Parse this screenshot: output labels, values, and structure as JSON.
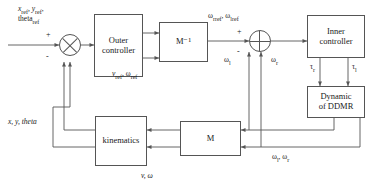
{
  "diagram": {
    "blocks": {
      "outer_controller": "Outer\ncontroller",
      "outer_controller_line1": "Outer",
      "outer_controller_line2": "controller",
      "m_inverse": "M⁻¹",
      "inner_controller_line1": "Inner",
      "inner_controller_line2": "controller",
      "dynamic_line1": "Dynamic",
      "dynamic_line2": "of DDMR",
      "m_matrix": "M",
      "kinematics": "kinematics"
    },
    "labels": {
      "reference_input_line1": "x",
      "reference_input_line1_sub1": "ref",
      "reference_input_line1_mid": ", y",
      "reference_input_line1_sub2": "ref",
      "reference_input_line1_end": ",",
      "reference_input_line2": "theta",
      "reference_input_line2_sub": "ref",
      "outer_output": "v",
      "outer_output_sub1": "ref",
      "outer_output_mid": ",  ω",
      "outer_output_sub2": "ref",
      "wheel_ref": "ω",
      "wheel_ref_sub1": "rref",
      "wheel_ref_mid": ", ω",
      "wheel_ref_sub2": "lref",
      "omega_l": "ω",
      "omega_l_sub": "l",
      "omega_r": "ω",
      "omega_r_sub": "r",
      "tau_r": "τ",
      "tau_r_sub": "r",
      "tau_l": "τ",
      "tau_l_sub": "l",
      "wheel_feedback": "ω",
      "wheel_feedback_sub1": "l",
      "wheel_feedback_mid": ", ω",
      "wheel_feedback_sub2": "r",
      "v_omega": "v, ω",
      "pose_feedback": "x, y, theta"
    },
    "signs": {
      "outer_plus": "+",
      "outer_minus": "-",
      "inner_plus": "+",
      "inner_minus": "-"
    },
    "colors": {
      "line": "#555555",
      "text": "#1a1a1a",
      "background": "#ffffff"
    }
  }
}
